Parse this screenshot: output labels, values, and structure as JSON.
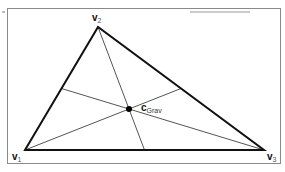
{
  "diagram": {
    "vertices": [
      {
        "name": "v",
        "sub": "1",
        "x": 25,
        "y": 150
      },
      {
        "name": "v",
        "sub": "2",
        "x": 98,
        "y": 27
      },
      {
        "name": "v",
        "sub": "3",
        "x": 264,
        "y": 150
      }
    ],
    "centroid": {
      "name": "c",
      "sub": "Grav",
      "x": 129,
      "y": 109
    },
    "colors": {
      "edge": "#111111",
      "median": "#555555",
      "frame": "#8a8a8a",
      "point": "#000000"
    }
  }
}
